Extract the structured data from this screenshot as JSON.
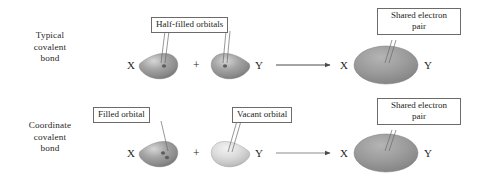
{
  "figure": {
    "background_color": "#ffffff",
    "ink_color": "#231f20",
    "box_border_color": "#6d6a68",
    "orbital_fill_dark": "#8c8c8c",
    "orbital_fill_light": "#d8d8d8",
    "merged_fill": "#9a9a9a"
  },
  "rows": [
    {
      "id": "typical-covalent-bond",
      "label_lines": [
        "Typical",
        "covalent",
        "bond"
      ],
      "reactant_left": {
        "atom": "X",
        "orbital_kind": "half-filled",
        "has_electron_dot": true
      },
      "operator": "+",
      "reactant_right": {
        "atom": "Y",
        "orbital_kind": "half-filled",
        "has_electron_dot": true
      },
      "arrow": "⟶",
      "product": {
        "atom_left": "X",
        "atom_right": "Y",
        "shape": "merged-ellipse"
      },
      "callouts": [
        {
          "id": "half-filled-orbitals",
          "text": "Half-filled orbitals",
          "lines": [
            "Half-filled orbitals"
          ],
          "leader_count": 2
        },
        {
          "id": "shared-electron-pair-top",
          "text": "Shared electron pair",
          "lines": [
            "Shared electron",
            "pair"
          ],
          "leader_count": 1
        }
      ]
    },
    {
      "id": "coordinate-covalent-bond",
      "label_lines": [
        "Coordinate",
        "covalent",
        "bond"
      ],
      "reactant_left": {
        "atom": "X",
        "orbital_kind": "filled",
        "has_electron_dot": true
      },
      "operator": "+",
      "reactant_right": {
        "atom": "Y",
        "orbital_kind": "vacant",
        "has_electron_dot": false
      },
      "arrow": "⟶",
      "product": {
        "atom_left": "X",
        "atom_right": "Y",
        "shape": "merged-ellipse"
      },
      "callouts": [
        {
          "id": "filled-orbital",
          "text": "Filled orbital",
          "lines": [
            "Filled orbital"
          ],
          "leader_count": 1
        },
        {
          "id": "vacant-orbital",
          "text": "Vacant orbital",
          "lines": [
            "Vacant orbital"
          ],
          "leader_count": 1
        },
        {
          "id": "shared-electron-pair-bottom",
          "text": "Shared electron pair",
          "lines": [
            "Shared electron",
            "pair"
          ],
          "leader_count": 1
        }
      ]
    }
  ]
}
